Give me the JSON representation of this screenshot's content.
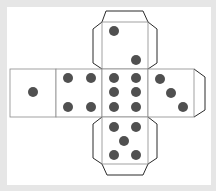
{
  "diagram": {
    "title": "Dice net",
    "colors": {
      "background": "#e6e6e6",
      "paper": "#ffffff",
      "fold_line": "#8a8a8a",
      "cut_line": "#2a2a2a",
      "pip": "#505050"
    },
    "faces": [
      {
        "name": "face-two",
        "value": 2,
        "position": "top"
      },
      {
        "name": "face-one",
        "value": 1,
        "position": "far-left"
      },
      {
        "name": "face-four",
        "value": 4,
        "position": "left"
      },
      {
        "name": "face-six",
        "value": 6,
        "position": "center"
      },
      {
        "name": "face-three",
        "value": 3,
        "position": "right"
      },
      {
        "name": "face-five",
        "value": 5,
        "position": "bottom"
      }
    ],
    "tabs": [
      "top-tab",
      "top-left-tab",
      "top-right-tab",
      "right-tab",
      "bottom-tab",
      "bottom-left-tab",
      "bottom-right-tab"
    ]
  }
}
